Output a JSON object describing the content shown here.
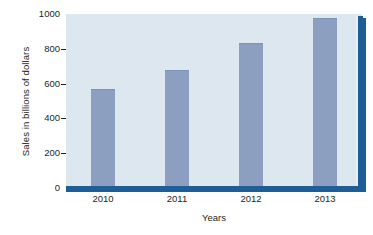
{
  "chart_data": {
    "type": "bar",
    "title": "",
    "subtitle": "",
    "xlabel": "Years",
    "ylabel": "Sales in billions of dollars",
    "categories": [
      "2010",
      "2011",
      "2012",
      "2013"
    ],
    "values": [
      565,
      675,
      825,
      970
    ],
    "series": [
      {
        "name": "Sales",
        "values": [
          565,
          675,
          825,
          970
        ]
      }
    ],
    "ylim": [
      0,
      1000
    ],
    "yticks": [
      0,
      200,
      400,
      600,
      800,
      1000
    ],
    "ytick_labels": [
      "0",
      "200",
      "400",
      "600",
      "800",
      "1000"
    ],
    "grid": false,
    "legend": false,
    "legend_position": "none",
    "annotations": []
  },
  "style": {
    "bar_color": "#8c9fc0",
    "plot_background": "#dde7ef",
    "axis_shadow_color": "#1f5d96",
    "text_color": "#231f20",
    "page_background": "#ffffff"
  }
}
